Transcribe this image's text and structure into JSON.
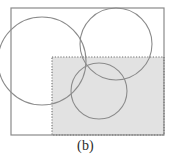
{
  "figure": {
    "caption": "(b)",
    "label_letter": "b",
    "type": "venn-diagram-with-shaded-region",
    "background_color": "#ffffff",
    "canvas": {
      "width": 171,
      "height": 161
    },
    "outer_rectangle": {
      "name": "universal-set-rectangle",
      "x": 11,
      "y": 8,
      "width": 153,
      "height": 127,
      "stroke_color": "#8a8a8a",
      "stroke_width": 1.2,
      "fill": "none",
      "line_style": "solid"
    },
    "shaded_rectangle": {
      "name": "shaded-dotted-rectangle",
      "x": 52,
      "y": 57,
      "width": 112,
      "height": 78,
      "fill_color": "#e2e2e2",
      "stroke_color": "#6e6e6e",
      "stroke_width": 1.1,
      "line_style": "dotted",
      "dash_pattern": "1.2 1.6"
    },
    "circles": [
      {
        "name": "circle-left",
        "cx": 42,
        "cy": 61,
        "r": 44,
        "stroke_color": "#8c8c8c",
        "stroke_width": 1.1,
        "fill": "none"
      },
      {
        "name": "circle-top-right",
        "cx": 116,
        "cy": 44,
        "r": 36,
        "stroke_color": "#8c8c8c",
        "stroke_width": 1.1,
        "fill": "none"
      },
      {
        "name": "circle-bottom-middle",
        "cx": 99,
        "cy": 91,
        "r": 28,
        "stroke_color": "#8c8c8c",
        "stroke_width": 1.1,
        "fill": "none"
      }
    ],
    "caption_color": "#2b2b2b"
  }
}
